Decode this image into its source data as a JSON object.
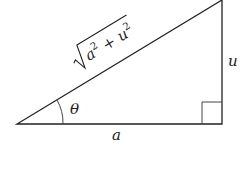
{
  "diagram": {
    "type": "right-triangle",
    "labels": {
      "hypotenuse_base": "a",
      "hypotenuse_sq1": "2",
      "hypotenuse_plus": " + ",
      "hypotenuse_u": "u",
      "hypotenuse_sq2": "2",
      "opposite": "u",
      "adjacent": "a",
      "angle": "θ"
    },
    "hypotenuse_expression": "√(a² + u²)",
    "right_angle_marker": true,
    "colors": {
      "stroke": "#222222",
      "background": "#ffffff"
    }
  }
}
